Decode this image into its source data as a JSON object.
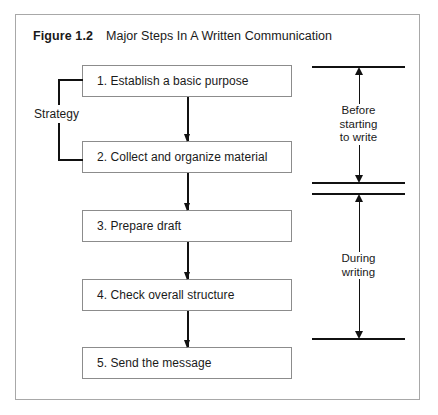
{
  "figure": {
    "number": "Figure 1.2",
    "title": "Major Steps In A Written Communication"
  },
  "steps": [
    {
      "label": "1. Establish a basic purpose"
    },
    {
      "label": "2. Collect and organize material"
    },
    {
      "label": "3. Prepare draft"
    },
    {
      "label": "4. Check overall structure"
    },
    {
      "label": "5. Send the message"
    }
  ],
  "annotations": {
    "strategy": "Strategy",
    "phase_before_line1": "Before",
    "phase_before_line2": "starting",
    "phase_before_line3": "to write",
    "phase_during_line1": "During",
    "phase_during_line2": "writing"
  },
  "colors": {
    "frame_border": "#a8a8a8",
    "box_border": "#8c8c8c",
    "line": "#111111",
    "text": "#1a1a1a",
    "background": "#ffffff"
  }
}
